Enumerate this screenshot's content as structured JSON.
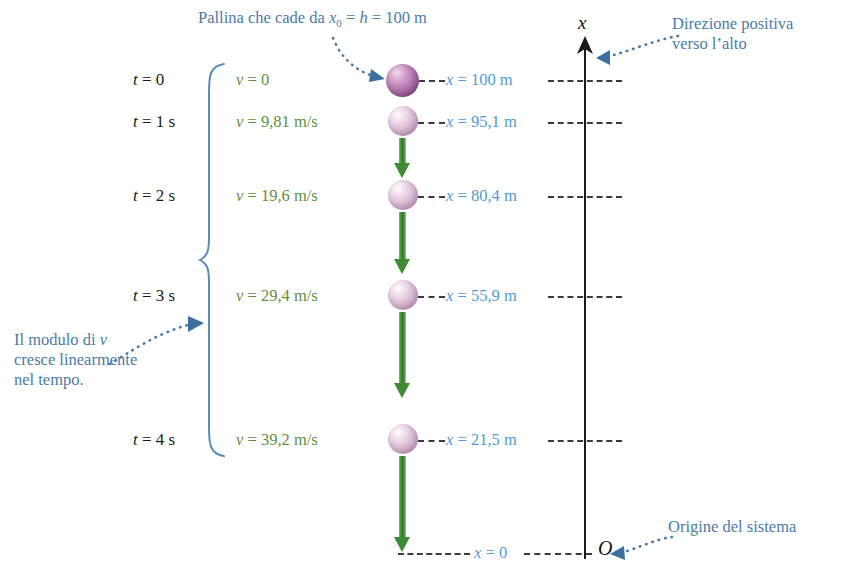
{
  "figure": {
    "title_note": "Pallina che cade da x",
    "annotations": {
      "top_drop": {
        "text_a": "Pallina che cade da ",
        "var_x": "x",
        "sub_0": "0",
        "eq1": " = ",
        "var_h": "h",
        "eq2": " = 100 m"
      },
      "positive_direction": {
        "line1": "Direzione positiva",
        "line2": "verso l’alto"
      },
      "linear_growth": {
        "line1_a": "Il modulo di ",
        "line1_var": "v",
        "line2": "cresce linearmente",
        "line3": "nel tempo."
      },
      "origin_note": "Origine del sistema"
    },
    "axis": {
      "name": "x",
      "origin_symbol": "O",
      "zero_label_var": "x",
      "zero_label_value": " = 0"
    },
    "rows": [
      {
        "time": "t = 0",
        "time_var": "t",
        "time_rest": " = 0",
        "velocity_var": "v",
        "velocity_rest": " = 0",
        "position_var": "x",
        "position_rest": " = 100 m",
        "position_value": 100,
        "velocity_value": 0,
        "time_value": 0
      },
      {
        "time": "t = 1 s",
        "time_var": "t",
        "time_rest": " = 1 s",
        "velocity_var": "v",
        "velocity_rest": " = 9,81 m/s",
        "position_var": "x",
        "position_rest": " = 95,1 m",
        "position_value": 95.1,
        "velocity_value": 9.81,
        "time_value": 1
      },
      {
        "time": "t = 2 s",
        "time_var": "t",
        "time_rest": " = 2 s",
        "velocity_var": "v",
        "velocity_rest": " = 19,6 m/s",
        "position_var": "x",
        "position_rest": " = 80,4 m",
        "position_value": 80.4,
        "velocity_value": 19.6,
        "time_value": 2
      },
      {
        "time": "t = 3 s",
        "time_var": "t",
        "time_rest": " = 3 s",
        "velocity_var": "v",
        "velocity_rest": " = 29,4 m/s",
        "position_var": "x",
        "position_rest": " = 55,9 m",
        "position_value": 55.9,
        "velocity_value": 29.4,
        "time_value": 3
      },
      {
        "time": "t = 4 s",
        "time_var": "t",
        "time_rest": " = 4 s",
        "velocity_var": "v",
        "velocity_rest": " = 39,2 m/s",
        "position_var": "x",
        "position_rest": " = 21,5 m",
        "position_value": 21.5,
        "velocity_value": 39.2,
        "time_value": 4
      }
    ],
    "colors": {
      "annotation_blue": "#4a7ba7",
      "velocity_green": "#5f8f3e",
      "position_blue": "#4f9ad6",
      "arrow_green": "#3f8a34",
      "ball_purple": "#8b4f89",
      "ball_pink": "#ddc0d6",
      "axis_black": "#1b1b1b"
    }
  }
}
